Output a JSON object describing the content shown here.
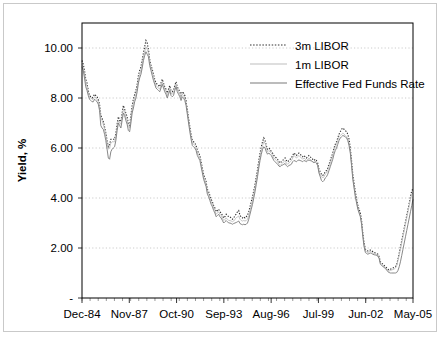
{
  "chart_data": {
    "type": "line",
    "title": "",
    "xlabel": "",
    "ylabel": "Yield, %",
    "ylim": [
      0,
      11
    ],
    "xlim": [
      0,
      245
    ],
    "grid": true,
    "y_ticks": [
      0,
      2,
      4,
      6,
      8,
      10
    ],
    "y_tick_labels": [
      "-",
      "2.00",
      "4.00",
      "6.00",
      "8.00",
      "10.00"
    ],
    "x_tick_labels": [
      "Dec-84",
      "Nov-87",
      "Oct-90",
      "Sep-93",
      "Aug-96",
      "Jul-99",
      "Jun-02",
      "May-05"
    ],
    "x_tick_positions": [
      0,
      35,
      70,
      105,
      140,
      175,
      210,
      245
    ],
    "legend_position": "top-right",
    "legend": [
      {
        "name": "3m LIBOR",
        "style": "dotted",
        "color": "#303030"
      },
      {
        "name": "1m LIBOR",
        "style": "solid",
        "color": "#bdbdbd"
      },
      {
        "name": "Effective Fed Funds Rate",
        "style": "solid",
        "color": "#7a7a7a"
      }
    ],
    "x_start_label": "Dec-84",
    "x_end_label": "May-05",
    "x_step_months": 1,
    "series": [
      {
        "name": "3m LIBOR",
        "style": "dotted",
        "color": "#303030",
        "values": [
          9.5,
          9.35,
          9.1,
          8.75,
          8.6,
          8.3,
          8.1,
          8.05,
          8.0,
          8.05,
          8.15,
          8.1,
          8.05,
          7.95,
          7.75,
          7.3,
          7.2,
          7.05,
          6.85,
          6.6,
          6.3,
          6.05,
          6.15,
          6.35,
          6.35,
          6.35,
          6.35,
          6.6,
          6.95,
          7.25,
          7.1,
          7.05,
          7.4,
          7.7,
          7.55,
          7.4,
          7.25,
          6.95,
          6.9,
          7.3,
          7.7,
          7.95,
          8.15,
          8.3,
          8.55,
          8.9,
          9.1,
          9.25,
          9.5,
          9.8,
          10.05,
          10.3,
          10.2,
          9.95,
          9.55,
          9.3,
          9.15,
          8.95,
          8.75,
          8.6,
          8.55,
          8.5,
          8.45,
          8.6,
          8.75,
          8.6,
          8.45,
          8.35,
          8.2,
          8.35,
          8.5,
          8.3,
          8.25,
          8.3,
          8.5,
          8.65,
          8.45,
          8.35,
          8.25,
          8.1,
          8.25,
          8.2,
          8.1,
          7.9,
          7.55,
          7.2,
          6.85,
          6.55,
          6.3,
          6.25,
          6.2,
          6.1,
          5.9,
          5.8,
          5.7,
          5.45,
          5.2,
          4.95,
          4.8,
          4.65,
          4.35,
          4.25,
          4.1,
          3.95,
          3.85,
          3.7,
          3.6,
          3.45,
          3.5,
          3.55,
          3.45,
          3.4,
          3.3,
          3.2,
          3.25,
          3.35,
          3.3,
          3.25,
          3.25,
          3.2,
          3.15,
          3.2,
          3.3,
          3.35,
          3.45,
          3.5,
          3.3,
          3.25,
          3.2,
          3.25,
          3.2,
          3.25,
          3.3,
          3.45,
          3.65,
          3.85,
          4.05,
          4.3,
          4.55,
          4.85,
          5.15,
          5.5,
          5.8,
          6.05,
          6.25,
          6.4,
          6.3,
          6.1,
          5.95,
          6.0,
          5.95,
          5.85,
          5.8,
          5.7,
          5.65,
          5.6,
          5.55,
          5.45,
          5.4,
          5.45,
          5.5,
          5.55,
          5.6,
          5.5,
          5.45,
          5.5,
          5.55,
          5.6,
          5.7,
          5.8,
          5.75,
          5.7,
          5.75,
          5.8,
          5.75,
          5.7,
          5.65,
          5.7,
          5.65,
          5.6,
          5.65,
          5.7,
          5.65,
          5.6,
          5.55,
          5.5,
          5.55,
          5.5,
          5.4,
          5.15,
          5.05,
          4.95,
          4.9,
          4.95,
          5.05,
          5.1,
          5.2,
          5.35,
          5.5,
          5.65,
          5.8,
          6.0,
          6.15,
          6.25,
          6.4,
          6.55,
          6.65,
          6.75,
          6.8,
          6.75,
          6.7,
          6.65,
          6.55,
          6.35,
          6.0,
          5.5,
          4.95,
          4.6,
          4.25,
          3.95,
          3.7,
          3.55,
          3.4,
          3.1,
          2.6,
          2.2,
          1.95,
          1.9,
          1.88,
          1.9,
          1.92,
          1.9,
          1.85,
          1.82,
          1.8,
          1.78,
          1.75,
          1.65,
          1.45,
          1.4,
          1.35,
          1.3,
          1.25,
          1.2,
          1.15,
          1.12,
          1.15,
          1.18,
          1.2,
          1.22,
          1.25,
          1.35,
          1.55,
          1.8,
          2.05,
          2.3,
          2.55,
          2.8,
          3.05,
          3.3,
          3.55,
          3.8,
          4.05,
          4.3,
          4.35
        ]
      },
      {
        "name": "1m LIBOR",
        "style": "solid",
        "color": "#bdbdbd",
        "values": [
          9.35,
          9.2,
          8.95,
          8.65,
          8.45,
          8.2,
          8.05,
          8.0,
          7.95,
          7.95,
          8.05,
          8.0,
          7.95,
          7.85,
          7.65,
          7.2,
          7.1,
          6.95,
          6.75,
          6.5,
          6.2,
          5.95,
          6.0,
          6.2,
          6.25,
          6.25,
          6.25,
          6.45,
          6.8,
          7.1,
          7.0,
          6.95,
          7.25,
          7.55,
          7.45,
          7.25,
          7.1,
          6.85,
          6.8,
          7.15,
          7.55,
          7.8,
          8.0,
          8.15,
          8.4,
          8.75,
          8.95,
          9.1,
          9.35,
          9.65,
          9.85,
          10.05,
          9.95,
          9.8,
          9.45,
          9.2,
          9.05,
          8.85,
          8.65,
          8.5,
          8.45,
          8.4,
          8.35,
          8.5,
          8.65,
          8.5,
          8.35,
          8.25,
          8.1,
          8.25,
          8.4,
          8.2,
          8.15,
          8.2,
          8.4,
          8.55,
          8.35,
          8.25,
          8.15,
          8.0,
          8.15,
          8.1,
          8.0,
          7.8,
          7.45,
          7.1,
          6.75,
          6.45,
          6.2,
          6.15,
          6.1,
          6.0,
          5.8,
          5.7,
          5.6,
          5.35,
          5.1,
          4.85,
          4.7,
          4.55,
          4.25,
          4.15,
          4.0,
          3.85,
          3.75,
          3.6,
          3.5,
          3.35,
          3.4,
          3.45,
          3.35,
          3.3,
          3.2,
          3.1,
          3.15,
          3.2,
          3.15,
          3.1,
          3.1,
          3.08,
          3.05,
          3.08,
          3.15,
          3.2,
          3.25,
          3.28,
          3.15,
          3.1,
          3.08,
          3.1,
          3.08,
          3.1,
          3.15,
          3.3,
          3.5,
          3.7,
          3.9,
          4.15,
          4.4,
          4.7,
          5.0,
          5.35,
          5.65,
          5.9,
          6.1,
          6.25,
          6.2,
          6.0,
          5.85,
          5.9,
          5.85,
          5.8,
          5.7,
          5.6,
          5.55,
          5.5,
          5.45,
          5.35,
          5.3,
          5.35,
          5.4,
          5.45,
          5.5,
          5.4,
          5.35,
          5.4,
          5.45,
          5.5,
          5.6,
          5.7,
          5.65,
          5.6,
          5.65,
          5.7,
          5.65,
          5.6,
          5.55,
          5.6,
          5.55,
          5.5,
          5.55,
          5.6,
          5.55,
          5.5,
          5.45,
          5.4,
          5.45,
          5.4,
          5.3,
          5.05,
          4.95,
          4.85,
          4.8,
          4.85,
          4.95,
          5.0,
          5.1,
          5.25,
          5.4,
          5.55,
          5.7,
          5.9,
          6.05,
          6.15,
          6.3,
          6.45,
          6.5,
          6.55,
          6.6,
          6.55,
          6.5,
          6.45,
          6.35,
          6.15,
          5.85,
          5.35,
          4.8,
          4.45,
          4.1,
          3.85,
          3.6,
          3.45,
          3.3,
          3.0,
          2.5,
          2.1,
          1.88,
          1.85,
          1.82,
          1.85,
          1.86,
          1.84,
          1.8,
          1.78,
          1.76,
          1.74,
          1.7,
          1.6,
          1.4,
          1.35,
          1.3,
          1.26,
          1.2,
          1.15,
          1.1,
          1.08,
          1.1,
          1.12,
          1.14,
          1.16,
          1.2,
          1.3,
          1.5,
          1.72,
          1.95,
          2.2,
          2.45,
          2.7,
          2.95,
          3.2,
          3.45,
          3.7,
          3.95,
          4.15,
          4.2
        ]
      },
      {
        "name": "Effective Fed Funds Rate",
        "style": "solid",
        "color": "#7a7a7a",
        "values": [
          9.25,
          9.1,
          8.8,
          8.45,
          8.3,
          8.1,
          7.95,
          7.9,
          7.85,
          7.85,
          7.95,
          7.9,
          7.85,
          7.75,
          7.5,
          6.9,
          6.8,
          6.75,
          6.55,
          6.3,
          5.95,
          5.6,
          5.55,
          5.85,
          5.95,
          6.0,
          6.05,
          6.3,
          6.7,
          7.0,
          6.9,
          6.8,
          7.1,
          7.4,
          7.3,
          7.1,
          6.95,
          6.7,
          6.65,
          7.0,
          7.4,
          7.6,
          7.85,
          8.0,
          8.25,
          8.6,
          8.8,
          8.95,
          9.2,
          9.5,
          9.7,
          9.85,
          9.75,
          9.65,
          9.3,
          9.1,
          8.9,
          8.7,
          8.55,
          8.4,
          8.35,
          8.3,
          8.25,
          8.4,
          8.55,
          8.4,
          8.25,
          8.15,
          8.0,
          8.15,
          8.3,
          8.1,
          8.05,
          8.1,
          8.3,
          8.45,
          8.25,
          8.15,
          8.05,
          7.9,
          8.05,
          8.0,
          7.9,
          7.7,
          7.35,
          7.0,
          6.65,
          6.35,
          6.1,
          6.05,
          6.0,
          5.9,
          5.7,
          5.6,
          5.5,
          5.25,
          5.0,
          4.75,
          4.6,
          4.45,
          4.15,
          4.05,
          3.9,
          3.75,
          3.65,
          3.5,
          3.4,
          3.25,
          3.3,
          3.35,
          3.25,
          3.2,
          3.1,
          3.0,
          3.05,
          3.1,
          3.05,
          3.0,
          3.0,
          2.98,
          2.95,
          2.98,
          3.0,
          3.02,
          3.05,
          3.08,
          2.98,
          2.95,
          2.93,
          2.95,
          2.93,
          2.95,
          3.0,
          3.15,
          3.35,
          3.55,
          3.75,
          4.0,
          4.25,
          4.55,
          4.85,
          5.2,
          5.5,
          5.75,
          5.95,
          6.05,
          6.0,
          5.85,
          5.75,
          5.8,
          5.75,
          5.7,
          5.6,
          5.5,
          5.45,
          5.4,
          5.35,
          5.28,
          5.25,
          5.3,
          5.32,
          5.35,
          5.38,
          5.3,
          5.25,
          5.3,
          5.32,
          5.35,
          5.45,
          5.5,
          5.48,
          5.45,
          5.5,
          5.52,
          5.5,
          5.48,
          5.45,
          5.5,
          5.48,
          5.45,
          5.5,
          5.52,
          5.5,
          5.48,
          5.45,
          5.42,
          5.45,
          5.4,
          5.3,
          5.0,
          4.85,
          4.7,
          4.65,
          4.7,
          4.8,
          4.85,
          4.95,
          5.1,
          5.25,
          5.4,
          5.55,
          5.75,
          5.9,
          6.0,
          6.15,
          6.3,
          6.4,
          6.45,
          6.5,
          6.48,
          6.45,
          6.4,
          6.3,
          6.1,
          5.8,
          5.3,
          4.75,
          4.4,
          4.05,
          3.8,
          3.55,
          3.4,
          3.25,
          2.95,
          2.45,
          2.05,
          1.82,
          1.78,
          1.75,
          1.78,
          1.8,
          1.78,
          1.75,
          1.73,
          1.72,
          1.7,
          1.68,
          1.58,
          1.35,
          1.3,
          1.26,
          1.22,
          1.18,
          1.12,
          1.05,
          1.02,
          1.0,
          1.0,
          1.0,
          1.0,
          1.0,
          1.02,
          1.1,
          1.25,
          1.45,
          1.7,
          1.95,
          2.2,
          2.45,
          2.7,
          2.95,
          3.2,
          3.45,
          3.7,
          3.95
        ]
      }
    ]
  }
}
